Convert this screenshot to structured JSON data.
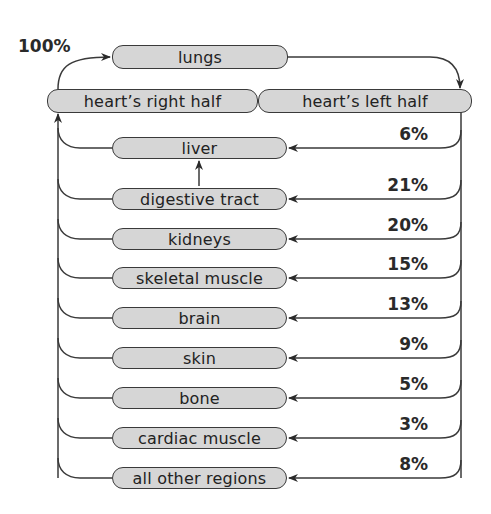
{
  "title_percent": "100%",
  "top": {
    "lungs": "lungs",
    "heart_right": "heart’s right half",
    "heart_left": "heart’s left half"
  },
  "organs": [
    {
      "label": "liver",
      "percent": "6%"
    },
    {
      "label": "digestive tract",
      "percent": "21%"
    },
    {
      "label": "kidneys",
      "percent": "20%"
    },
    {
      "label": "skeletal muscle",
      "percent": "15%"
    },
    {
      "label": "brain",
      "percent": "13%"
    },
    {
      "label": "skin",
      "percent": "9%"
    },
    {
      "label": "bone",
      "percent": "5%"
    },
    {
      "label": "cardiac muscle",
      "percent": "3%"
    },
    {
      "label": "all other regions",
      "percent": "8%"
    }
  ],
  "colors": {
    "box_fill": "#d6d6d6",
    "line": "#3a3a3a",
    "text": "#222222"
  }
}
